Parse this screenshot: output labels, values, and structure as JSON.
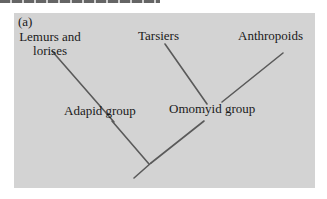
{
  "figure": {
    "panel_label": "(a)",
    "background_color": "#d3d3d3",
    "line_color": "#555555"
  },
  "nodes": {
    "lemurs_line1": "Lemurs and",
    "lemurs_line2": "lorises",
    "tarsiers": "Tarsiers",
    "anthropoids": "Anthropoids",
    "adapid": "Adapid group",
    "omomyid": "Omomyid group"
  },
  "branches": [
    {
      "from": "Lemurs and lorises",
      "to": "Adapid group"
    },
    {
      "from": "Tarsiers",
      "to": "Omomyid group"
    },
    {
      "from": "Anthropoids",
      "to": "Omomyid group"
    },
    {
      "from": "Adapid group",
      "to": "root"
    },
    {
      "from": "Omomyid group",
      "to": "root"
    }
  ]
}
